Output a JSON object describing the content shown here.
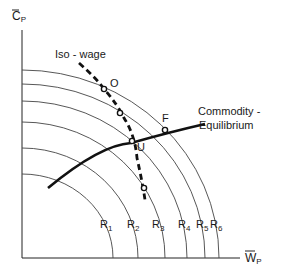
{
  "diagram": {
    "axes": {
      "y_label_main": "C",
      "y_label_sub": "P",
      "x_label_main": "W",
      "x_label_sub": "P"
    },
    "curves": {
      "iso_wage_label": "Iso - wage",
      "commodity_label_line1": "Commodity -",
      "commodity_label_line2": "Equilibrium"
    },
    "points": [
      {
        "id": "O",
        "label": "O"
      },
      {
        "id": "U",
        "label": "U"
      },
      {
        "id": "F",
        "label": "F"
      }
    ],
    "arcs": [
      {
        "main": "R",
        "sub": "1"
      },
      {
        "main": "R",
        "sub": "2"
      },
      {
        "main": "R",
        "sub": "3"
      },
      {
        "main": "R",
        "sub": "4"
      },
      {
        "main": "R",
        "sub": "5"
      },
      {
        "main": "R",
        "sub": "6"
      }
    ]
  }
}
